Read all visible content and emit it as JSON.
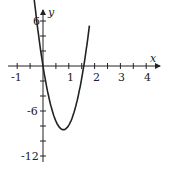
{
  "chart_data": {
    "type": "line",
    "title": "",
    "xlabel": "x",
    "ylabel": "y",
    "xlim": [
      -1.2,
      4.5
    ],
    "ylim": [
      -13,
      7
    ],
    "x_ticks": [
      -1,
      1,
      2,
      3,
      4
    ],
    "y_ticks": [
      6,
      -6,
      -12
    ],
    "grid": false,
    "series": [
      {
        "name": "f(x)",
        "x": [
          -0.35,
          -0.2,
          0,
          0.2,
          0.4,
          0.6,
          0.79,
          1.0,
          1.2,
          1.4,
          1.58,
          1.8
        ],
        "y": [
          6.0,
          3.5,
          0,
          -3.6,
          -6.2,
          -7.8,
          -8.5,
          -7.5,
          -5.8,
          -3.0,
          0,
          6.0
        ]
      }
    ]
  },
  "labels": {
    "x_axis": "x",
    "y_axis": "y",
    "xt": [
      "-1",
      "1",
      "2",
      "3",
      "4"
    ],
    "yt": [
      "6",
      "-6",
      "-12"
    ]
  }
}
